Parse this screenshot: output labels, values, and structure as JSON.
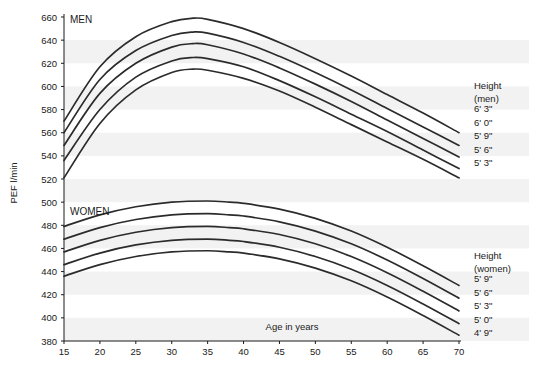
{
  "chart_data": {
    "type": "line",
    "title": "",
    "xlabel": "Age in years",
    "ylabel": "PEF l/min",
    "xlim": [
      15,
      70
    ],
    "ylim": [
      380,
      660
    ],
    "grid": "faint horizontal bands",
    "legend_position": "right",
    "xticks": [
      15,
      20,
      25,
      30,
      35,
      40,
      45,
      50,
      55,
      60,
      65,
      70
    ],
    "yticks": [
      380,
      400,
      420,
      440,
      460,
      480,
      500,
      520,
      540,
      560,
      580,
      600,
      620,
      640,
      660
    ],
    "panels": [
      {
        "label": "MEN",
        "legend_title": "Height",
        "legend_subtitle": "(men)",
        "series": [
          {
            "name": "6' 3\"",
            "x": [
              15,
              20,
              25,
              30,
              33,
              35,
              40,
              45,
              50,
              55,
              60,
              65,
              70
            ],
            "values": [
              570,
              617,
              643,
              656,
              659,
              658,
              650,
              638,
              624,
              609,
              593,
              577,
              560
            ]
          },
          {
            "name": "6' 0\"",
            "x": [
              15,
              20,
              25,
              30,
              33,
              35,
              40,
              45,
              50,
              55,
              60,
              65,
              70
            ],
            "values": [
              560,
              606,
              631,
              644,
              647,
              646,
              638,
              626,
              612,
              597,
              581,
              565,
              549
            ]
          },
          {
            "name": "5' 9\"",
            "x": [
              15,
              20,
              25,
              30,
              33,
              35,
              40,
              45,
              50,
              55,
              60,
              65,
              70
            ],
            "values": [
              549,
              594,
              620,
              634,
              637,
              636,
              628,
              616,
              602,
              587,
              571,
              555,
              539
            ]
          },
          {
            "name": "5' 6\"",
            "x": [
              15,
              20,
              25,
              30,
              33,
              35,
              40,
              45,
              50,
              55,
              60,
              65,
              70
            ],
            "values": [
              536,
              580,
              608,
              622,
              625,
              624,
              617,
              605,
              591,
              576,
              561,
              545,
              529
            ]
          },
          {
            "name": "5' 3\"",
            "x": [
              15,
              20,
              25,
              30,
              33,
              35,
              40,
              45,
              50,
              55,
              60,
              65,
              70
            ],
            "values": [
              521,
              568,
              597,
              612,
              615,
              614,
              607,
              596,
              582,
              567,
              552,
              537,
              521
            ]
          }
        ]
      },
      {
        "label": "WOMEN",
        "legend_title": "Height",
        "legend_subtitle": "(women)",
        "series": [
          {
            "name": "5' 9\"",
            "x": [
              15,
              20,
              25,
              30,
              35,
              38,
              40,
              45,
              50,
              55,
              60,
              65,
              70
            ],
            "values": [
              479,
              489,
              496,
              500,
              501,
              500,
              499,
              494,
              486,
              475,
              461,
              445,
              428
            ]
          },
          {
            "name": "5' 6\"",
            "x": [
              15,
              20,
              25,
              30,
              35,
              38,
              40,
              45,
              50,
              55,
              60,
              65,
              70
            ],
            "values": [
              468,
              478,
              485,
              489,
              490,
              489,
              488,
              483,
              475,
              464,
              450,
              434,
              417
            ]
          },
          {
            "name": "5' 3\"",
            "x": [
              15,
              20,
              25,
              30,
              35,
              38,
              40,
              45,
              50,
              55,
              60,
              65,
              70
            ],
            "values": [
              457,
              467,
              474,
              478,
              479,
              478,
              477,
              472,
              464,
              453,
              439,
              423,
              406
            ]
          },
          {
            "name": "5' 0\"",
            "x": [
              15,
              20,
              25,
              30,
              35,
              38,
              40,
              45,
              50,
              55,
              60,
              65,
              70
            ],
            "values": [
              446,
              456,
              463,
              467,
              468,
              467,
              466,
              461,
              453,
              442,
              428,
              412,
              395
            ]
          },
          {
            "name": "4' 9\"",
            "x": [
              15,
              20,
              25,
              30,
              35,
              38,
              40,
              45,
              50,
              55,
              60,
              65,
              70
            ],
            "values": [
              436,
              446,
              453,
              457,
              458,
              457,
              456,
              451,
              443,
              432,
              418,
              402,
              385
            ]
          }
        ]
      }
    ]
  },
  "axes": {
    "y_title": "PEF l/min",
    "x_title": "Age in years",
    "y_tick_labels": [
      "660",
      "640",
      "620",
      "600",
      "580",
      "560",
      "540",
      "520",
      "500",
      "480",
      "460",
      "440",
      "420",
      "400",
      "380"
    ],
    "x_tick_labels": [
      "15",
      "20",
      "25",
      "30",
      "35",
      "40",
      "45",
      "50",
      "55",
      "60",
      "65",
      "70"
    ]
  },
  "panels": {
    "men": {
      "label": "MEN",
      "legend_title": "Height",
      "legend_subtitle": "(men)",
      "legend_items": [
        "6' 3\"",
        "6' 0\"",
        "5' 9\"",
        "5' 6\"",
        "5' 3\""
      ]
    },
    "women": {
      "label": "WOMEN",
      "legend_title": "Height",
      "legend_subtitle": "(women)",
      "legend_items": [
        "5' 9\"",
        "5' 6\"",
        "5' 3\"",
        "5' 0\"",
        "4' 9\""
      ]
    }
  },
  "colors": {
    "curve": "#2b2b2b",
    "axis": "#1a1a1a",
    "band": "#f2f2f2",
    "background": "#ffffff"
  }
}
